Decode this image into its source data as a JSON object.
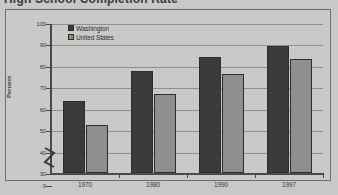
{
  "title": "High School Completion Rate",
  "chart_data": {
    "type": "bar",
    "title": "High School Completion Rate",
    "xlabel": "",
    "ylabel": "Percent",
    "categories": [
      "1970",
      "1980",
      "1990",
      "1997"
    ],
    "series": [
      {
        "name": "Washington",
        "color": "#3b3b3b",
        "values": [
          63.5,
          77.5,
          84.0,
          89.5
        ]
      },
      {
        "name": "United States",
        "color": "#8e8e8e",
        "values": [
          52.5,
          67.0,
          76.0,
          83.0
        ]
      }
    ],
    "ylim": [
      30,
      100
    ],
    "yticks": [
      0,
      30,
      40,
      50,
      60,
      70,
      80,
      90,
      100
    ],
    "ytick_labels": [
      "0",
      "30",
      "40",
      "50",
      "60",
      "70",
      "80",
      "90",
      "100"
    ],
    "axis_break": true,
    "grid": true,
    "legend_position": "top-left"
  },
  "colors": {
    "background": "#c8c8c6",
    "frame_border": "#6e6e6e",
    "gridline": "#8f8f8f",
    "axis": "#4a4a4a",
    "text": "#3d3d3d",
    "series_washington": "#3b3b3b",
    "series_united_states": "#8e8e8e"
  }
}
